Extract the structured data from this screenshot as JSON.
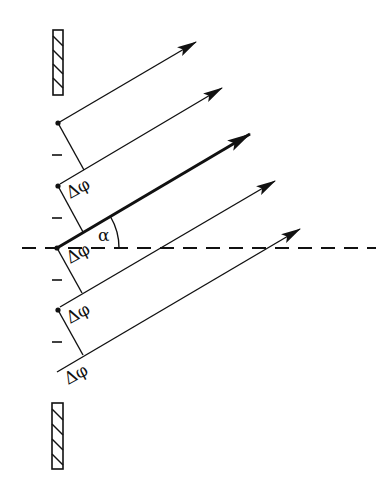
{
  "diagram": {
    "colors": {
      "ink": "#111111",
      "background": "#ffffff"
    },
    "labels": {
      "angle": "α",
      "phase_diffs": [
        "Δφ",
        "Δφ",
        "Δφ",
        "Δφ"
      ],
      "ticks": [
        "–",
        "–",
        "–",
        "–"
      ]
    },
    "rays": [
      {
        "from": [
          58,
          123
        ],
        "to": [
          196,
          42
        ],
        "thick": false
      },
      {
        "from": [
          60,
          184
        ],
        "to": [
          222,
          88
        ],
        "thick": false
      },
      {
        "from": [
          57,
          248
        ],
        "to": [
          250,
          134
        ],
        "thick": true
      },
      {
        "from": [
          60,
          307
        ],
        "to": [
          275,
          181
        ],
        "thick": false
      },
      {
        "from": [
          57,
          372
        ],
        "to": [
          300,
          229
        ],
        "thick": false
      }
    ],
    "sources": [
      [
        58,
        123
      ],
      [
        58,
        186
      ],
      [
        57,
        248
      ],
      [
        58,
        310
      ]
    ],
    "perpendiculars": [
      {
        "from": [
          58,
          123
        ],
        "to": [
          84,
          170
        ]
      },
      {
        "from": [
          58,
          186
        ],
        "to": [
          83,
          232
        ]
      },
      {
        "from": [
          57,
          248
        ],
        "to": [
          82,
          293
        ]
      },
      {
        "from": [
          58,
          310
        ],
        "to": [
          83,
          355
        ]
      }
    ],
    "axis": {
      "from": [
        22,
        248
      ],
      "to": [
        376,
        248
      ],
      "style": "dashed"
    },
    "walls": [
      {
        "x": 53,
        "y": 30,
        "w": 10,
        "h": 65
      },
      {
        "x": 52,
        "y": 403,
        "w": 11,
        "h": 66
      }
    ]
  }
}
